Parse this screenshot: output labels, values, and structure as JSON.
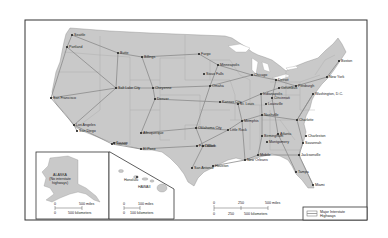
{
  "map": {
    "title": "Major Interstate Highways",
    "colors": {
      "land": "#c9c9c9",
      "water": "#ffffff",
      "frame": "#333333",
      "highway": "#8a8a8a",
      "state_border": "#a8a8a8",
      "city": "#222222"
    },
    "cities": [
      {
        "name": "Seattle",
        "x": 72,
        "y": 35
      },
      {
        "name": "Portland",
        "x": 67,
        "y": 47
      },
      {
        "name": "Butte",
        "x": 118,
        "y": 53
      },
      {
        "name": "Billings",
        "x": 142,
        "y": 57
      },
      {
        "name": "Fargo",
        "x": 199,
        "y": 54
      },
      {
        "name": "Minneapolis",
        "x": 218,
        "y": 65
      },
      {
        "name": "Sioux Falls",
        "x": 204,
        "y": 74
      },
      {
        "name": "San Francisco",
        "x": 51,
        "y": 98
      },
      {
        "name": "Salt Lake City",
        "x": 116,
        "y": 88
      },
      {
        "name": "Cheyenne",
        "x": 153,
        "y": 88
      },
      {
        "name": "Denver",
        "x": 155,
        "y": 99
      },
      {
        "name": "Omaha",
        "x": 210,
        "y": 86
      },
      {
        "name": "Kansas City",
        "x": 220,
        "y": 102
      },
      {
        "name": "Chicago",
        "x": 252,
        "y": 75
      },
      {
        "name": "Detroit",
        "x": 276,
        "y": 80
      },
      {
        "name": "Indianapolis",
        "x": 261,
        "y": 94
      },
      {
        "name": "Columbus",
        "x": 279,
        "y": 88
      },
      {
        "name": "Cincinnati",
        "x": 272,
        "y": 98
      },
      {
        "name": "Pittsburgh",
        "x": 296,
        "y": 86
      },
      {
        "name": "St. Louis",
        "x": 238,
        "y": 104
      },
      {
        "name": "Louisville",
        "x": 266,
        "y": 104
      },
      {
        "name": "Boston",
        "x": 339,
        "y": 61
      },
      {
        "name": "New York",
        "x": 327,
        "y": 77
      },
      {
        "name": "Washington, D.C.",
        "x": 313,
        "y": 94
      },
      {
        "name": "Los Angeles",
        "x": 74,
        "y": 125
      },
      {
        "name": "San Diego",
        "x": 77,
        "y": 131
      },
      {
        "name": "Albuquerque",
        "x": 141,
        "y": 133
      },
      {
        "name": "Phoenix",
        "x": 112,
        "y": 144
      },
      {
        "name": "Tucson",
        "x": 114,
        "y": 143
      },
      {
        "name": "El Paso",
        "x": 141,
        "y": 149
      },
      {
        "name": "Oklahoma City",
        "x": 196,
        "y": 128
      },
      {
        "name": "Dallas",
        "x": 203,
        "y": 146
      },
      {
        "name": "Fort Worth",
        "x": 197,
        "y": 146
      },
      {
        "name": "Little Rock",
        "x": 228,
        "y": 130
      },
      {
        "name": "Memphis",
        "x": 242,
        "y": 121
      },
      {
        "name": "Nashville",
        "x": 262,
        "y": 115
      },
      {
        "name": "Birmingham",
        "x": 262,
        "y": 136
      },
      {
        "name": "Atlanta",
        "x": 278,
        "y": 134
      },
      {
        "name": "Montgomery",
        "x": 267,
        "y": 142
      },
      {
        "name": "Charlotte",
        "x": 297,
        "y": 120
      },
      {
        "name": "Charleston",
        "x": 306,
        "y": 136
      },
      {
        "name": "Savannah",
        "x": 303,
        "y": 143
      },
      {
        "name": "Jacksonville",
        "x": 299,
        "y": 155
      },
      {
        "name": "Mobile",
        "x": 258,
        "y": 155
      },
      {
        "name": "New Orleans",
        "x": 245,
        "y": 160
      },
      {
        "name": "Houston",
        "x": 213,
        "y": 166
      },
      {
        "name": "San Antonio",
        "x": 192,
        "y": 168
      },
      {
        "name": "Tampa",
        "x": 296,
        "y": 172
      },
      {
        "name": "Miami",
        "x": 313,
        "y": 185
      }
    ],
    "alaska_inset": {
      "label_line1": "ALASKA",
      "label_line2": "(No interstate",
      "label_line3": "highways)",
      "scale_miles": [
        "0",
        "500 miles"
      ],
      "scale_km": [
        "0",
        "500 kilometers"
      ]
    },
    "hawaii_inset": {
      "city": "Honolulu",
      "island_label": "HAWAII",
      "scale_miles": [
        "0",
        "100 miles"
      ],
      "scale_km": [
        "0",
        "100 kilometers"
      ]
    },
    "main_scale": {
      "miles": [
        "0",
        "250",
        "500 miles"
      ],
      "km": [
        "0",
        "250",
        "500 kilometers"
      ]
    },
    "legend": {
      "label_line1": "Major Interstate",
      "label_line2": "Highways"
    }
  }
}
